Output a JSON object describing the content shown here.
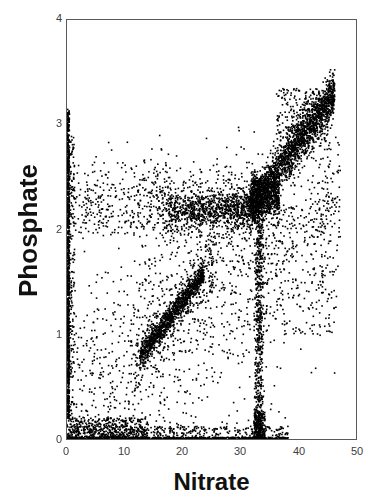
{
  "chart_data": {
    "type": "scatter",
    "title": "",
    "xlabel": "Nitrate",
    "ylabel": "Phosphate",
    "xlim": [
      0,
      50
    ],
    "ylim": [
      0,
      4
    ],
    "xticks": [
      "0",
      "10",
      "20",
      "30",
      "40",
      "50"
    ],
    "xtick_values": [
      0,
      10,
      20,
      30,
      40,
      50
    ],
    "yticks": [
      "0",
      "1",
      "2",
      "3",
      "4"
    ],
    "ytick_values": [
      0,
      1,
      2,
      3,
      4
    ],
    "grid": false,
    "legend": null,
    "marker": {
      "shape": "square",
      "size_px": 1.6,
      "color": "#000000"
    },
    "frame_color": "#5a5a5a",
    "n_points_approx": 6000,
    "series": [
      {
        "name": "Nitrate vs Phosphate",
        "description": "Dense black point cloud; strong positive association with several structured sub-populations",
        "features": [
          {
            "name": "zero-nitrate-vertical-line",
            "x": 0.0,
            "y_range": [
              0.2,
              3.15
            ],
            "density": "very-high"
          },
          {
            "name": "zero-phosphate-horizontal-line",
            "y": 0.0,
            "x_range": [
              0.0,
              38.0
            ],
            "density": "very-high"
          },
          {
            "name": "lower-diagonal-band",
            "x_range": [
              12.5,
              23.5
            ],
            "y_range": [
              0.75,
              1.55
            ],
            "slope": 0.072,
            "density": "very-high"
          },
          {
            "name": "mid-horizontal-band",
            "x_range": [
              17.0,
              33.0
            ],
            "y": 2.2,
            "y_spread": 0.09,
            "density": "high"
          },
          {
            "name": "upper-right-cluster",
            "x_range": [
              31.0,
              46.0
            ],
            "y_range": [
              2.15,
              3.35
            ],
            "slope": 0.075,
            "density": "very-high"
          },
          {
            "name": "nitrate-33-vertical-stripe",
            "x": 33.0,
            "y_range": [
              0.0,
              2.5
            ],
            "density": "high"
          },
          {
            "name": "diffuse-background",
            "x_range": [
              0.0,
              47.0
            ],
            "y_range": [
              0.0,
              3.0
            ],
            "density": "low"
          },
          {
            "name": "upper-left-scatter",
            "x_range": [
              0.0,
              18.0
            ],
            "y_range": [
              2.0,
              2.85
            ],
            "density": "low-medium"
          }
        ],
        "sample_points": [
          [
            0.1,
            3.12
          ],
          [
            0.2,
            2.95
          ],
          [
            0.1,
            2.8
          ],
          [
            0.3,
            2.62
          ],
          [
            0.1,
            2.45
          ],
          [
            0.2,
            2.3
          ],
          [
            0.1,
            2.18
          ],
          [
            0.2,
            2.05
          ],
          [
            0.1,
            1.88
          ],
          [
            0.3,
            1.7
          ],
          [
            0.1,
            1.52
          ],
          [
            0.2,
            1.35
          ],
          [
            0.1,
            1.18
          ],
          [
            0.2,
            1.0
          ],
          [
            0.1,
            0.82
          ],
          [
            0.3,
            0.64
          ],
          [
            0.1,
            0.46
          ],
          [
            0.2,
            0.3
          ],
          [
            1.2,
            0.02
          ],
          [
            3.5,
            0.03
          ],
          [
            6.8,
            0.01
          ],
          [
            9.4,
            0.02
          ],
          [
            12.1,
            0.03
          ],
          [
            15.6,
            0.01
          ],
          [
            18.9,
            0.02
          ],
          [
            22.3,
            0.03
          ],
          [
            25.7,
            0.01
          ],
          [
            28.4,
            0.02
          ],
          [
            31.2,
            0.03
          ],
          [
            33.1,
            0.01
          ],
          [
            35.6,
            0.02
          ],
          [
            37.8,
            0.01
          ],
          [
            13.0,
            0.82
          ],
          [
            14.2,
            0.92
          ],
          [
            15.4,
            1.0
          ],
          [
            16.6,
            1.08
          ],
          [
            17.8,
            1.16
          ],
          [
            19.0,
            1.24
          ],
          [
            20.2,
            1.32
          ],
          [
            21.4,
            1.4
          ],
          [
            22.4,
            1.47
          ],
          [
            23.0,
            1.52
          ],
          [
            18.5,
            2.2
          ],
          [
            20.0,
            2.21
          ],
          [
            22.5,
            2.19
          ],
          [
            25.0,
            2.22
          ],
          [
            27.5,
            2.2
          ],
          [
            30.0,
            2.23
          ],
          [
            32.0,
            2.21
          ],
          [
            31.5,
            2.25
          ],
          [
            33.0,
            2.35
          ],
          [
            34.0,
            2.45
          ],
          [
            35.5,
            2.55
          ],
          [
            37.0,
            2.65
          ],
          [
            38.5,
            2.72
          ],
          [
            40.0,
            2.82
          ],
          [
            41.5,
            2.9
          ],
          [
            43.0,
            2.98
          ],
          [
            44.5,
            3.04
          ],
          [
            45.5,
            3.0
          ],
          [
            42.0,
            3.2
          ],
          [
            43.5,
            3.28
          ],
          [
            40.5,
            3.12
          ],
          [
            38.0,
            2.98
          ],
          [
            33.0,
            1.95
          ],
          [
            33.1,
            1.6
          ],
          [
            32.9,
            1.25
          ],
          [
            33.2,
            0.9
          ],
          [
            33.0,
            0.55
          ],
          [
            33.1,
            0.25
          ],
          [
            33.0,
            0.1
          ],
          [
            2.0,
            2.45
          ],
          [
            4.5,
            2.38
          ],
          [
            7.0,
            2.5
          ],
          [
            9.5,
            2.3
          ],
          [
            12.0,
            2.42
          ],
          [
            14.5,
            2.28
          ],
          [
            16.0,
            2.55
          ],
          [
            5.0,
            2.7
          ],
          [
            10.0,
            2.62
          ],
          [
            3.0,
            1.8
          ],
          [
            6.0,
            1.55
          ],
          [
            8.0,
            1.2
          ],
          [
            11.0,
            0.95
          ],
          [
            5.5,
            0.6
          ],
          [
            2.5,
            0.35
          ],
          [
            7.5,
            0.45
          ],
          [
            26.0,
            1.8
          ],
          [
            28.0,
            1.5
          ],
          [
            29.5,
            1.15
          ],
          [
            27.0,
            0.85
          ],
          [
            24.0,
            0.6
          ],
          [
            30.5,
            0.4
          ],
          [
            36.0,
            1.9
          ],
          [
            38.0,
            1.4
          ],
          [
            40.0,
            1.05
          ],
          [
            42.0,
            0.65
          ],
          [
            44.0,
            2.15
          ],
          [
            45.0,
            2.6
          ],
          [
            46.0,
            2.3
          ],
          [
            35.0,
            0.3
          ],
          [
            37.5,
            0.22
          ]
        ]
      }
    ]
  },
  "axis": {
    "x_label": "Nitrate",
    "y_label": "Phosphate",
    "x_ticks": [
      "0",
      "10",
      "20",
      "30",
      "40",
      "50"
    ],
    "y_ticks": [
      "0",
      "1",
      "2",
      "3",
      "4"
    ]
  }
}
